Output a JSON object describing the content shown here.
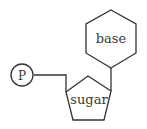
{
  "diagram": {
    "components": {
      "phosphate": {
        "label": "P",
        "shape": "circle"
      },
      "sugar": {
        "label": "sugar",
        "shape": "pentagon"
      },
      "base": {
        "label": "base",
        "shape": "hexagon"
      }
    },
    "connections": [
      {
        "from": "phosphate",
        "to": "sugar"
      },
      {
        "from": "sugar",
        "to": "base"
      }
    ],
    "colors": {
      "stroke": "#333333",
      "text": "#3a3a3a",
      "background": "#ffffff"
    }
  }
}
